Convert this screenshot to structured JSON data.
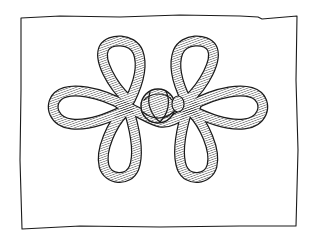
{
  "illustration": {
    "subject": "frog closure knot",
    "background": "#ffffff",
    "ink": "#1a1a1a",
    "cord_fill": "#ffffff"
  }
}
